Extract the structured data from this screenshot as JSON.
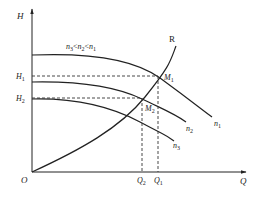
{
  "diagram": {
    "axes": {
      "y_label": "H",
      "x_label": "Q",
      "origin_label": "O"
    },
    "condition_label": {
      "n_a": "n",
      "sub_a": "3",
      "lt1": "<",
      "n_b": "n",
      "sub_b": "2",
      "lt2": "<",
      "n_c": "n",
      "sub_c": "1"
    },
    "curves": [
      {
        "id": "n1",
        "label": "n",
        "sub": "1"
      },
      {
        "id": "n2",
        "label": "n",
        "sub": "2"
      },
      {
        "id": "n3",
        "label": "n",
        "sub": "3"
      }
    ],
    "resistance_curve": {
      "label": "R"
    },
    "operating_points": [
      {
        "label": "M",
        "sub": "1",
        "h_label": "H",
        "h_sub": "1",
        "q_label": "Q",
        "q_sub": "1"
      },
      {
        "label": "M",
        "sub": "2",
        "h_label": "H",
        "h_sub": "2",
        "q_label": "Q",
        "q_sub": "2"
      }
    ],
    "colors": {
      "line": "#222222",
      "background": "#ffffff"
    }
  }
}
